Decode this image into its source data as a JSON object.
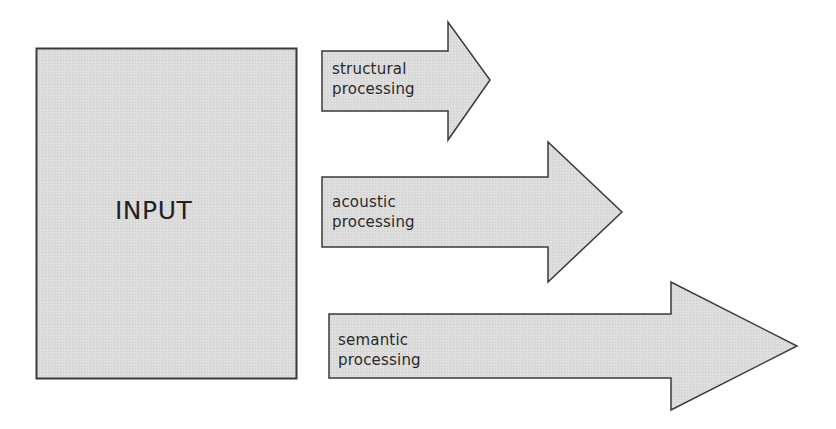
{
  "diagram": {
    "colors": {
      "fill": "#dcdcdc",
      "stroke": "#3a3a3a",
      "text": "#2a2a2a",
      "background": "#ffffff"
    },
    "input_box": {
      "label": "INPUT"
    },
    "arrows": [
      {
        "line1": "structural",
        "line2": "processing"
      },
      {
        "line1": "acoustic",
        "line2": "processing"
      },
      {
        "line1": "semantic",
        "line2": "processing"
      }
    ]
  }
}
